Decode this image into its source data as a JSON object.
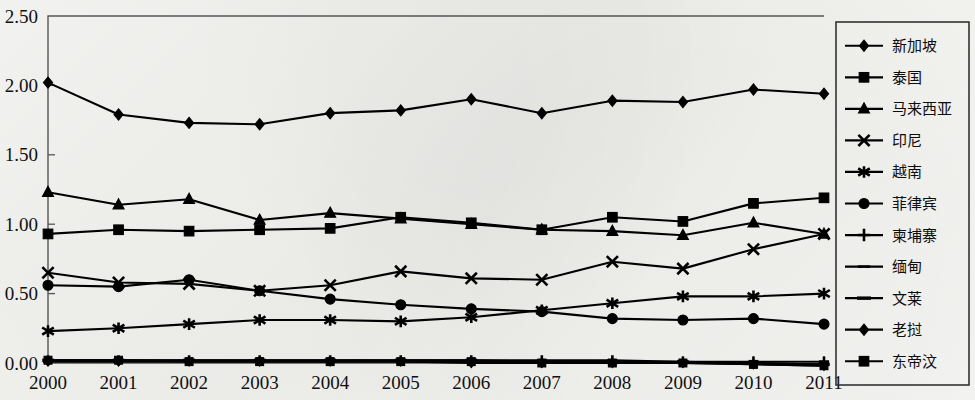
{
  "chart_data": {
    "type": "line",
    "title": "",
    "xlabel": "",
    "ylabel": "",
    "categories": [
      "2000",
      "2001",
      "2002",
      "2003",
      "2004",
      "2005",
      "2006",
      "2007",
      "2008",
      "2009",
      "2010",
      "2011"
    ],
    "x": [
      2000,
      2001,
      2002,
      2003,
      2004,
      2005,
      2006,
      2007,
      2008,
      2009,
      2010,
      2011
    ],
    "ylim": [
      0.0,
      2.5
    ],
    "xlim": [
      2000,
      2011
    ],
    "yticks": [
      "0.00",
      "0.50",
      "1.00",
      "1.50",
      "2.00",
      "2.50"
    ],
    "ytick_values": [
      0.0,
      0.5,
      1.0,
      1.5,
      2.0,
      2.5
    ],
    "grid": false,
    "legend_position": "right",
    "series": [
      {
        "name": "新加坡",
        "marker": "diamond",
        "values": [
          2.02,
          1.79,
          1.73,
          1.72,
          1.8,
          1.82,
          1.9,
          1.8,
          1.89,
          1.88,
          1.97,
          1.94
        ]
      },
      {
        "name": "泰国",
        "marker": "square",
        "values": [
          0.93,
          0.96,
          0.95,
          0.96,
          0.97,
          1.05,
          1.01,
          0.96,
          1.05,
          1.02,
          1.15,
          1.19
        ]
      },
      {
        "name": "马来西亚",
        "marker": "triangle",
        "values": [
          1.23,
          1.14,
          1.18,
          1.03,
          1.08,
          1.04,
          1.0,
          0.96,
          0.95,
          0.92,
          1.01,
          0.93
        ]
      },
      {
        "name": "印尼",
        "marker": "cross-x",
        "values": [
          0.65,
          0.58,
          0.57,
          0.52,
          0.56,
          0.66,
          0.61,
          0.6,
          0.73,
          0.68,
          0.82,
          0.93
        ]
      },
      {
        "name": "越南",
        "marker": "asterisk",
        "values": [
          0.23,
          0.25,
          0.28,
          0.31,
          0.31,
          0.3,
          0.33,
          0.38,
          0.43,
          0.48,
          0.48,
          0.5
        ]
      },
      {
        "name": "菲律宾",
        "marker": "circle",
        "values": [
          0.56,
          0.55,
          0.6,
          0.52,
          0.46,
          0.42,
          0.39,
          0.37,
          0.32,
          0.31,
          0.32,
          0.28
        ]
      },
      {
        "name": "柬埔寨",
        "marker": "plus",
        "values": [
          0.02,
          0.02,
          0.02,
          0.02,
          0.02,
          0.02,
          0.02,
          0.02,
          0.02,
          0.01,
          0.01,
          0.01
        ]
      },
      {
        "name": "缅甸",
        "marker": "dash",
        "values": [
          0.01,
          0.01,
          0.01,
          0.01,
          0.01,
          0.01,
          0.01,
          0.01,
          0.0,
          0.0,
          0.0,
          -0.01
        ]
      },
      {
        "name": "文莱",
        "marker": "line",
        "values": [
          0.02,
          0.02,
          0.02,
          0.02,
          0.02,
          0.02,
          0.02,
          0.01,
          0.01,
          0.01,
          0.0,
          -0.01
        ]
      },
      {
        "name": "老挝",
        "marker": "diamond",
        "values": [
          0.01,
          0.01,
          0.01,
          0.01,
          0.01,
          0.01,
          0.0,
          0.0,
          0.0,
          0.0,
          -0.01,
          -0.02
        ]
      },
      {
        "name": "东帝汶",
        "marker": "square",
        "values": [
          0.02,
          0.02,
          0.01,
          0.01,
          0.01,
          0.01,
          0.01,
          0.0,
          0.0,
          0.0,
          -0.01,
          -0.02
        ]
      }
    ]
  }
}
